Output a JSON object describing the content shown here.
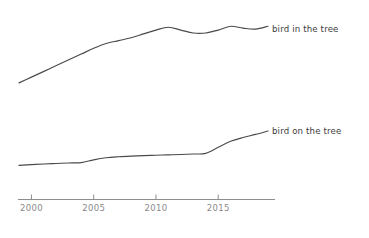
{
  "chart_data": {
    "type": "line",
    "title": "",
    "xlabel": "",
    "ylabel": "",
    "grid": false,
    "legend_position": "right-inline-end-of-line",
    "xlim": [
      1999,
      2019
    ],
    "xticks": [
      2000,
      2005,
      2010,
      2015
    ],
    "xtick_labels": [
      "2000",
      "2005",
      "2010",
      "2015"
    ],
    "ylim": [
      0,
      100
    ],
    "yticks": [],
    "ytick_labels": [],
    "x": [
      1999,
      2000,
      2001,
      2002,
      2003,
      2004,
      2005,
      2006,
      2007,
      2008,
      2009,
      2010,
      2011,
      2012,
      2013,
      2014,
      2015,
      2016,
      2017,
      2018,
      2019
    ],
    "series": [
      {
        "name": "bird in the tree",
        "label": "bird in the tree",
        "color": "#4a4a4a",
        "values": [
          22,
          28,
          34,
          40,
          46,
          52,
          58,
          63,
          66,
          69,
          73,
          77,
          80,
          77,
          74,
          74,
          77,
          81,
          79,
          78,
          81
        ]
      },
      {
        "name": "bird on the tree",
        "label": "bird on the tree",
        "color": "#4a4a4a",
        "values": [
          12,
          12.4,
          12.8,
          13.1,
          13.4,
          13.6,
          15.2,
          16.4,
          17.0,
          17.4,
          17.7,
          17.9,
          18.1,
          18.3,
          18.6,
          19.0,
          22.5,
          26.0,
          28.2,
          30.0,
          32.0
        ]
      }
    ],
    "axis": {
      "x_axis_visible": true,
      "y_axis_visible": false,
      "tick_color": "#8d8d8d",
      "label_color": "#8a8a8a"
    }
  },
  "colors": {
    "background": "#ffffff",
    "line": "#4a4a4a",
    "axis": "#8d8d8d",
    "tick_text": "#8a8a8a",
    "series_text": "#3d3d3d"
  }
}
